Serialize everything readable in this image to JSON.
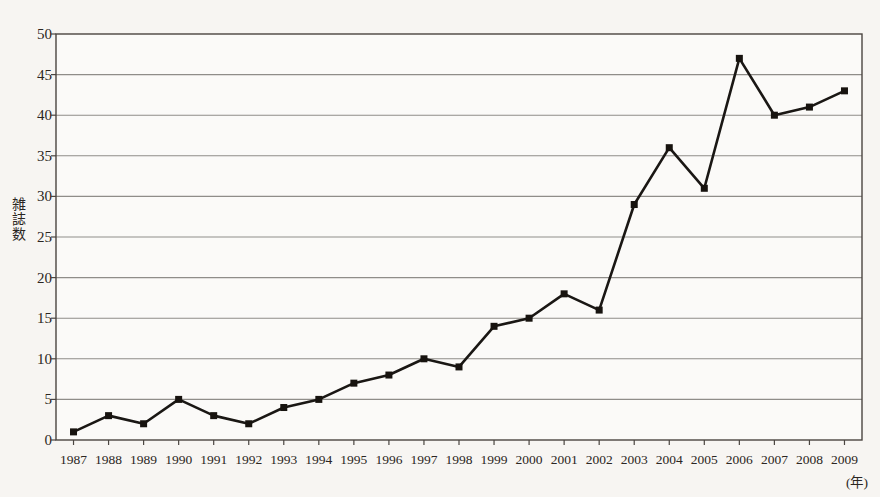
{
  "chart_data": {
    "type": "line",
    "title": "",
    "xlabel": "(年)",
    "ylabel": "雑誌数",
    "categories": [
      1987,
      1988,
      1989,
      1990,
      1991,
      1992,
      1993,
      1994,
      1995,
      1996,
      1997,
      1998,
      1999,
      2000,
      2001,
      2002,
      2003,
      2004,
      2005,
      2006,
      2007,
      2008,
      2009
    ],
    "tick_labels": [
      "1987",
      "1988",
      "1989",
      "1990",
      "1991",
      "1992",
      "1993",
      "1994",
      "1995",
      "1996",
      "1997",
      "1998",
      "1999",
      "2000",
      "2001",
      "2002",
      "2003",
      "2004",
      "2005",
      "2006",
      "2007",
      "2008",
      "2009"
    ],
    "values": [
      1,
      3,
      2,
      5,
      3,
      2,
      4,
      5,
      7,
      8,
      10,
      9,
      14,
      15,
      18,
      16,
      29,
      36,
      31,
      47,
      40,
      41,
      43
    ],
    "ylim": [
      0,
      50
    ],
    "ytick_values": [
      0,
      5,
      10,
      15,
      20,
      25,
      30,
      35,
      40,
      45,
      50
    ],
    "ytick_labels": [
      "0",
      "5",
      "10",
      "15",
      "20",
      "25",
      "30",
      "35",
      "40",
      "45",
      "50"
    ],
    "grid": true,
    "legend": "none",
    "series": [
      {
        "name": "雑誌数",
        "values": [
          1,
          3,
          2,
          5,
          3,
          2,
          4,
          5,
          7,
          8,
          10,
          9,
          14,
          15,
          18,
          16,
          29,
          36,
          31,
          47,
          40,
          41,
          43
        ]
      }
    ],
    "marker": "square",
    "colors": {
      "line": "#1a1714",
      "marker": "#17130f",
      "grid": "#8f8d89",
      "axis": "#4a4540",
      "background": "#f7f5f2",
      "plot_background": "#fbfaf8",
      "text": "#2b2622"
    }
  },
  "ylabel_chars": [
    "雑",
    "誌",
    "数"
  ]
}
